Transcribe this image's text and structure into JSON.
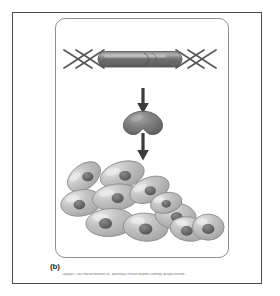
{
  "figure": {
    "panel_label": "(b)",
    "copyright": "Copyright © 2005 Pearson Education, Inc., publishing as Pearson Benjamin Cummings. All rights reserved.",
    "colors": {
      "outer_frame": "#4c4c4c",
      "inner_panel_border": "#8e8e8e",
      "background": "#ffffff",
      "dna_strand": "#5a5a5a",
      "gene_bar_dark": "#6b6b6b",
      "gene_bar_highlight": "#a9a9a9",
      "arrow": "#3c3c3c",
      "protein_body": "#808080",
      "protein_shade": "#6a6a6a",
      "cell_body": "#b9b9b9",
      "cell_highlight": "#e4e4e4",
      "cell_outline": "#8a8a8a",
      "nucleus": "#6f6f6f",
      "nucleus_core": "#565656",
      "caption_text": "#2b2b2b",
      "copyright_text": "#6d6d6d"
    }
  },
  "stages": {
    "dna": {
      "name": "dna-double-helix-with-gene",
      "label": "DNA double helix containing a gene segment",
      "gene_segment_label": "gene"
    },
    "arrow_1": {
      "name": "arrow-transcription-translation",
      "label": "leads to"
    },
    "protein": {
      "name": "protein-molecule",
      "label": "Protein product"
    },
    "arrow_2": {
      "name": "arrow-protein-effect",
      "label": "acts on"
    },
    "cells": {
      "name": "cell-cluster",
      "label": "Cluster of cells with nuclei",
      "cell_count": 11
    }
  },
  "cells": [
    {
      "cx": 30,
      "cy": 24,
      "rx": 20,
      "ry": 13,
      "rot": -38,
      "nx": 34,
      "ny": 24,
      "nr": 6.0
    },
    {
      "cx": 71,
      "cy": 22,
      "rx": 24,
      "ry": 14,
      "rot": -16,
      "nx": 74,
      "ny": 23,
      "nr": 6.4
    },
    {
      "cx": 27,
      "cy": 52,
      "rx": 22,
      "ry": 14,
      "rot": -10,
      "nx": 25,
      "ny": 54,
      "nr": 6.2
    },
    {
      "cx": 64,
      "cy": 46,
      "rx": 25,
      "ry": 14,
      "rot": -8,
      "nx": 66,
      "ny": 47,
      "nr": 6.4
    },
    {
      "cx": 100,
      "cy": 38,
      "rx": 22,
      "ry": 13,
      "rot": -22,
      "nx": 101,
      "ny": 39,
      "nr": 6.0
    },
    {
      "cx": 58,
      "cy": 73,
      "rx": 26,
      "ry": 15,
      "rot": -4,
      "nx": 53,
      "ny": 74,
      "nr": 7.0
    },
    {
      "cx": 96,
      "cy": 78,
      "rx": 24,
      "ry": 15,
      "rot": 4,
      "nx": 96,
      "ny": 80,
      "nr": 7.2
    },
    {
      "cx": 128,
      "cy": 66,
      "rx": 22,
      "ry": 14,
      "rot": 6,
      "nx": 129,
      "ny": 67,
      "nr": 6.2
    },
    {
      "cx": 142,
      "cy": 80,
      "rx": 20,
      "ry": 13,
      "rot": 8,
      "nx": 140,
      "ny": 82,
      "nr": 6.4
    },
    {
      "cx": 163,
      "cy": 78,
      "rx": 17,
      "ry": 14,
      "rot": 0,
      "nx": 163,
      "ny": 80,
      "nr": 6.6
    },
    {
      "cx": 118,
      "cy": 52,
      "rx": 17,
      "ry": 11,
      "rot": -12,
      "nx": 118,
      "ny": 53,
      "nr": 5.0
    }
  ]
}
